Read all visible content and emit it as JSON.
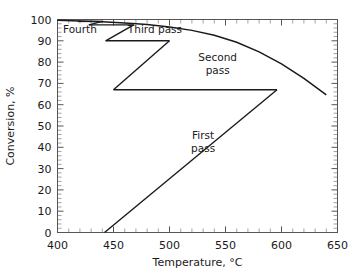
{
  "chart_data": {
    "type": "line",
    "title": "",
    "xlabel": "Temperature, °C",
    "ylabel": "Conversion, %",
    "xlim": [
      400,
      650
    ],
    "ylim": [
      0,
      100
    ],
    "xticks": [
      400,
      450,
      500,
      550,
      600,
      650
    ],
    "yticks": [
      0,
      10,
      20,
      30,
      40,
      50,
      60,
      70,
      80,
      90,
      100
    ],
    "xtick_labels": [
      "400",
      "450",
      "500",
      "550",
      "600",
      "650"
    ],
    "ytick_labels": [
      "0",
      "10",
      "20",
      "30",
      "40",
      "50",
      "60",
      "70",
      "80",
      "90",
      "100"
    ],
    "x_minor_step": 10,
    "y_minor_step": 2,
    "grid": false,
    "legend": "none",
    "series": [
      {
        "name": "Equilibrium curve",
        "type": "line",
        "points": [
          [
            400,
            99.6
          ],
          [
            420,
            99.3
          ],
          [
            440,
            99.0
          ],
          [
            460,
            98.4
          ],
          [
            480,
            97.6
          ],
          [
            500,
            96.5
          ],
          [
            520,
            94.9
          ],
          [
            540,
            92.6
          ],
          [
            560,
            89.3
          ],
          [
            580,
            84.8
          ],
          [
            600,
            79.2
          ],
          [
            620,
            72.4
          ],
          [
            640,
            64.6
          ]
        ]
      },
      {
        "name": "First pass",
        "type": "line",
        "points": [
          [
            442,
            0
          ],
          [
            596,
            67
          ]
        ]
      },
      {
        "name": "First pass interstage cooling",
        "type": "line",
        "points": [
          [
            596,
            67
          ],
          [
            450,
            67
          ]
        ]
      },
      {
        "name": "Second pass",
        "type": "line",
        "points": [
          [
            450,
            67
          ],
          [
            500,
            90
          ]
        ]
      },
      {
        "name": "Second pass interstage cooling",
        "type": "line",
        "points": [
          [
            500,
            90
          ],
          [
            443,
            90
          ]
        ]
      },
      {
        "name": "Third pass",
        "type": "line",
        "points": [
          [
            443,
            90
          ],
          [
            468,
            97.5
          ]
        ]
      },
      {
        "name": "Third pass interstage cooling",
        "type": "line",
        "points": [
          [
            468,
            97.5
          ],
          [
            428,
            97.5
          ]
        ]
      },
      {
        "name": "Fourth pass",
        "type": "line",
        "points": [
          [
            428,
            97.5
          ],
          [
            440,
            99.1
          ]
        ]
      },
      {
        "name": "Fourth pass interstage cooling",
        "type": "line",
        "points": [
          [
            440,
            99.1
          ],
          [
            418,
            99.1
          ]
        ]
      }
    ],
    "annotations": [
      {
        "text": "Fourth",
        "x": 420,
        "y": 93.5
      },
      {
        "text": "Third pass",
        "x": 487,
        "y": 93.5
      },
      {
        "text": "Second",
        "x": 543,
        "y": 80.5
      },
      {
        "text": "pass",
        "x": 543,
        "y": 74.5
      },
      {
        "text": "First",
        "x": 530,
        "y": 44.0
      },
      {
        "text": "pass",
        "x": 530,
        "y": 38.0
      }
    ]
  },
  "colors": {
    "data_line": "#1a1a1a",
    "frame": "#555555",
    "minor_tick": "#8a8a8a",
    "background": "#ffffff",
    "text": "#1a1a1a"
  }
}
